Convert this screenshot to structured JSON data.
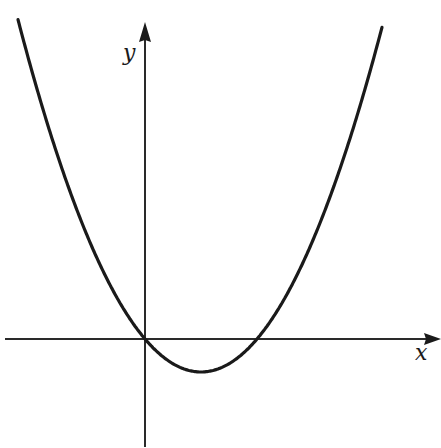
{
  "figure": {
    "x_axis_label": "x",
    "y_axis_label": "y",
    "colors": {
      "background": "#ffffff",
      "curve": "#1a1a1a",
      "axes": "#2a2a2a"
    }
  },
  "chart_data": {
    "type": "line",
    "title": "",
    "xlabel": "x",
    "ylabel": "y",
    "grid": false,
    "legend": null,
    "series": [
      {
        "name": "parabola",
        "shape": "upward parabola",
        "points_px_relative_to_origin": [
          {
            "x": -127,
            "y": 317
          },
          {
            "x": 0,
            "y": 0
          },
          {
            "x": 56,
            "y": -33
          },
          {
            "x": 112,
            "y": 0
          },
          {
            "x": 237,
            "y": 317
          }
        ],
        "roots": [
          "0 (origin)",
          "positive x-intercept"
        ],
        "vertex": "below x-axis, right of y-axis"
      }
    ],
    "axes": {
      "x_axis_arrow": "right",
      "y_axis_arrow": "up",
      "tick_labels": []
    }
  }
}
